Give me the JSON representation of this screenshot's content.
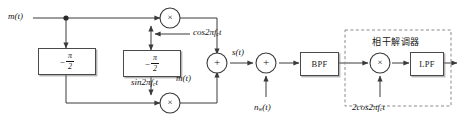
{
  "diagram": {
    "type": "signal-flow-block-diagram",
    "colors": {
      "line": "#3a3a3a",
      "block_border": "#4a4a4a",
      "dashed_border": "#7a7a7a",
      "text": "#141414",
      "background": "#ffffff"
    }
  },
  "signals": {
    "input_message": "m(t)",
    "carrier_cos": "cos2πf",
    "carrier_cos_sub": "c",
    "carrier_cos_tail": "t",
    "carrier_sin": "sin2πf",
    "carrier_sin_sub": "c",
    "carrier_sin_tail": "t",
    "quadrature_message": "m(t)",
    "modulated_output": "s(t)",
    "noise": "n",
    "noise_sub": "w",
    "noise_tail": "(t)",
    "local_oscillator": "2cos2πf",
    "local_oscillator_sub": "c",
    "local_oscillator_tail": "t"
  },
  "blocks": {
    "phase_shift_left": {
      "name": "phase-shifter",
      "minus": "−",
      "numerator": "π",
      "denominator": "2"
    },
    "phase_shift_middle": {
      "name": "phase-shifter",
      "minus": "−",
      "numerator": "π",
      "denominator": "2"
    },
    "bandpass_filter": {
      "label": "BPF"
    },
    "lowpass_filter": {
      "label": "LPF"
    }
  },
  "operators": {
    "multiplier_top": "×",
    "multiplier_bottom": "×",
    "multiplier_demod": "×",
    "adder_modulator": "+",
    "adder_channel": "+"
  },
  "groups": {
    "demodulator": {
      "label": "相干解调器"
    }
  }
}
